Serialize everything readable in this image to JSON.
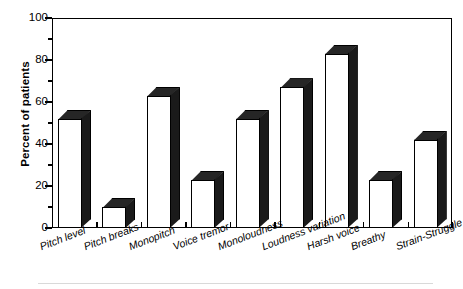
{
  "chart_data": {
    "type": "bar",
    "title": "",
    "subtitle": "",
    "xlabel": "",
    "ylabel": "Percent of patients",
    "ylim": [
      0,
      100
    ],
    "ytick_major": [
      0,
      20,
      40,
      60,
      80,
      100
    ],
    "ytick_minor": [
      10,
      30,
      50,
      70,
      90
    ],
    "ytick_labels": [
      "0",
      "20",
      "40",
      "60",
      "80",
      "100"
    ],
    "grid": false,
    "legend": null,
    "style": "3d-bar",
    "bar_face_color": "#ffffff",
    "bar_edge_color": "#000000",
    "bar_shade_color": "#1a1a1a",
    "categories": [
      "Pitch level",
      "Pitch breaks",
      "Monopitch",
      "Voice tremor",
      "Monoloudness",
      "Loudness variation",
      "Harsh voice",
      "Breathy",
      "Strain-Struggle"
    ],
    "values": [
      52,
      10,
      63,
      23,
      52,
      67,
      83,
      23,
      42
    ],
    "series": [
      {
        "name": "Percent of patients",
        "values": [
          52,
          10,
          63,
          23,
          52,
          67,
          83,
          23,
          42
        ]
      }
    ]
  },
  "axes": {
    "y_title": "Percent of patients"
  }
}
